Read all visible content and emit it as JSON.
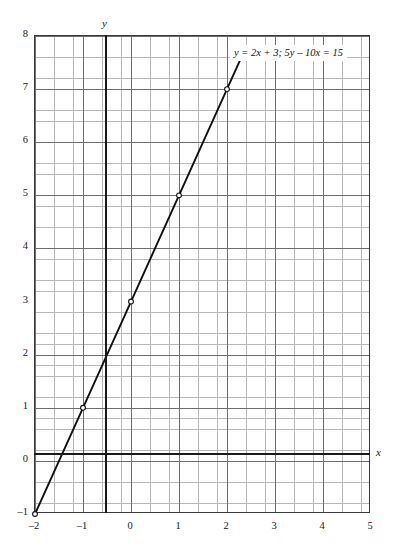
{
  "chart_data": {
    "type": "line",
    "title": "",
    "xlabel": "x",
    "ylabel": "y",
    "xlim": [
      -2,
      5
    ],
    "ylim": [
      -1,
      8
    ],
    "grid": true,
    "minor_grid_divisions": 5,
    "legend": "none",
    "annotations": [
      {
        "text": "y = 2x + 3; 5y – 10x = 15",
        "x": 2.1,
        "y": 7.6
      }
    ],
    "xticks": [
      -2,
      -1,
      0,
      1,
      2,
      3,
      4,
      5
    ],
    "xticklabels": [
      "–2",
      "–1",
      "0",
      "1",
      "2",
      "3",
      "4",
      "5"
    ],
    "yticks": [
      -1,
      0,
      1,
      2,
      3,
      4,
      5,
      6,
      7,
      8
    ],
    "yticklabels": [
      "–1",
      "0",
      "1",
      "2",
      "3",
      "4",
      "5",
      "6",
      "7",
      "8"
    ],
    "series": [
      {
        "name": "y = 2x + 3",
        "equation": "y = 2x + 3",
        "alternate_form": "5y – 10x = 15",
        "slope": 2,
        "intercept": 3,
        "color": "#111111",
        "marker": "open-circle",
        "x": [
          -2,
          -1,
          0,
          1,
          2,
          2.27
        ],
        "y": [
          -1,
          1,
          3,
          5,
          7,
          7.54
        ],
        "marked_points": [
          {
            "x": -2,
            "y": -1
          },
          {
            "x": -1,
            "y": 1
          },
          {
            "x": 0,
            "y": 3
          },
          {
            "x": 1,
            "y": 5
          },
          {
            "x": 2,
            "y": 7
          }
        ]
      }
    ]
  },
  "axes": {
    "y_letter": "y",
    "x_letter": "x"
  }
}
